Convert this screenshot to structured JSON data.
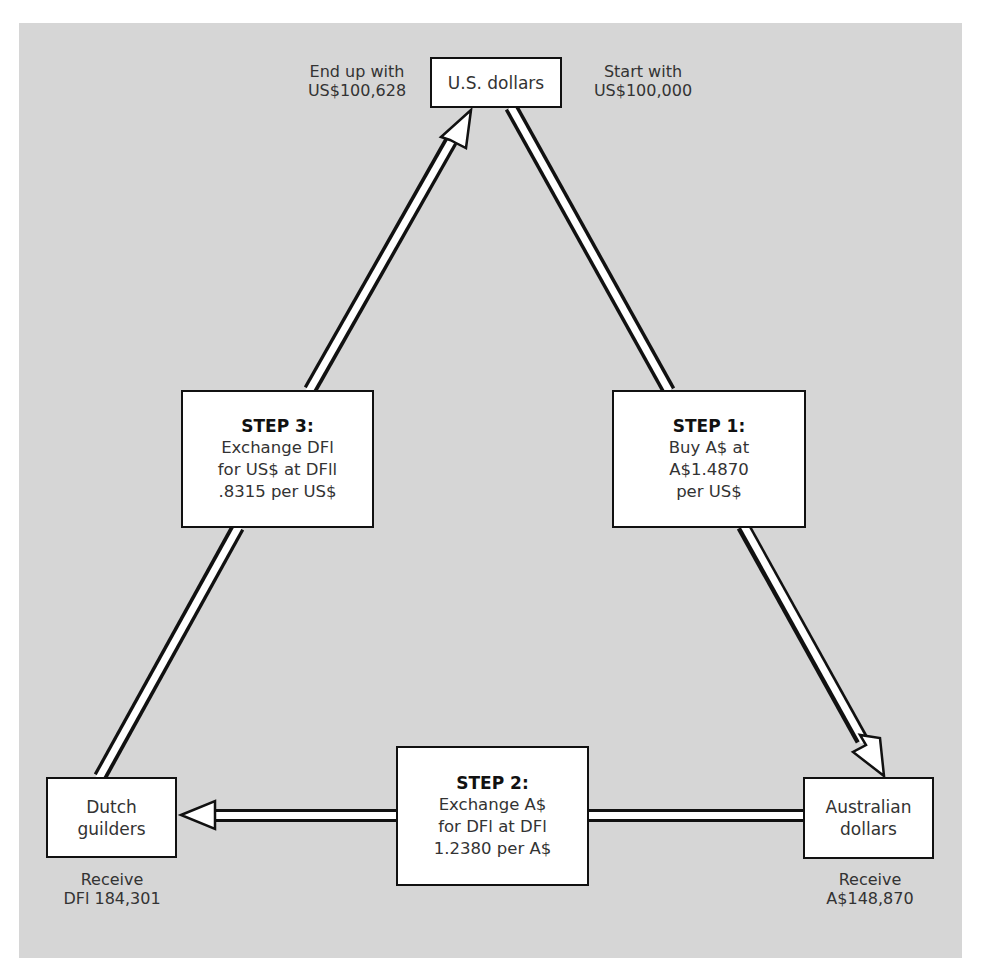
{
  "colors": {
    "background": "#d6d6d6",
    "box_fill": "#ffffff",
    "stroke": "#111111"
  },
  "nodes": {
    "us": {
      "line1": "U.S. dollars"
    },
    "aud": {
      "line1": "Australian",
      "line2": "dollars"
    },
    "dfl": {
      "line1": "Dutch",
      "line2": "guilders"
    }
  },
  "labels": {
    "end": {
      "line1": "End up with",
      "line2": "US$100,628"
    },
    "start": {
      "line1": "Start with",
      "line2": "US$100,000"
    },
    "receive_aud": {
      "line1": "Receive",
      "line2": "A$148,870"
    },
    "receive_dfl": {
      "line1": "Receive",
      "line2": "DFl 184,301"
    }
  },
  "steps": [
    {
      "title": "STEP 1:",
      "lines": [
        "Buy A$ at",
        "A$1.4870",
        "per US$"
      ]
    },
    {
      "title": "STEP 2:",
      "lines": [
        "Exchange A$",
        "for DFl at DFl",
        "1.2380 per A$"
      ]
    },
    {
      "title": "STEP 3:",
      "lines": [
        "Exchange DFl",
        "for US$ at DFll",
        ".8315 per US$"
      ]
    }
  ]
}
